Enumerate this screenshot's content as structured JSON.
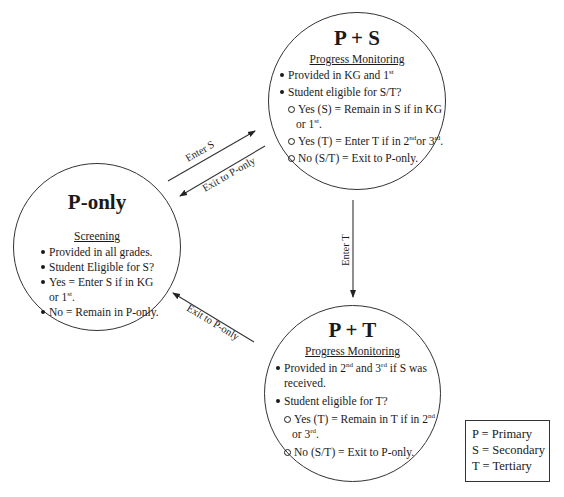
{
  "nodes": {
    "p_only": {
      "title": "P-only",
      "subtitle": "Screening",
      "items": [
        {
          "text": "Provided in all grades."
        },
        {
          "text": "Student Eligible for S?"
        },
        {
          "text": "Yes = Enter S if in KG",
          "cont": "or 1",
          "cont_sup": "st",
          "cont_after": "."
        },
        {
          "text": "No = Remain in P-only."
        }
      ]
    },
    "p_s": {
      "title": "P + S",
      "subtitle": "Progress Monitoring",
      "items": [
        {
          "text": "Provided in KG and  1",
          "sup": "st"
        },
        {
          "text": "Student eligible for S/T?"
        }
      ],
      "subitems": [
        {
          "text": "Yes (S) = Remain in S if in KG",
          "cont": "or 1",
          "cont_sup": "st",
          "cont_after": "."
        },
        {
          "text": "Yes (T) = Enter T if in 2",
          "sup": "nd",
          "mid": "or 3",
          "sup2": "rd",
          "after": "."
        },
        {
          "text": "No (S/T) = Exit to P-only."
        }
      ]
    },
    "p_t": {
      "title": "P + T",
      "subtitle": "Progress Monitoring",
      "items": [
        {
          "text": "Provided in 2",
          "sup": "nd",
          "mid": " and 3",
          "sup2": "rd",
          "after": " if S was",
          "cont": "received."
        },
        {
          "text": "Student eligible for T?"
        }
      ],
      "subitems": [
        {
          "text": "Yes (T) = Remain in T if in 2",
          "sup": "nd",
          "cont": "or 3",
          "cont_sup": "rd",
          "cont_after": "."
        },
        {
          "text": "No (S/T) = Exit to P-only."
        }
      ]
    }
  },
  "edges": {
    "enter_s": "Enter S",
    "exit_from_s": "Exit to P-only",
    "enter_t": "Enter T",
    "exit_from_t": "Exit to P-only"
  },
  "legend": {
    "items": [
      "P = Primary",
      "S = Secondary",
      "T = Tertiary"
    ]
  }
}
